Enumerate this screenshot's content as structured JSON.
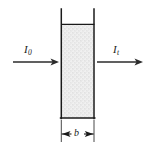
{
  "figure": {
    "type": "schematic-diagram",
    "background_color": "#ffffff",
    "line_color": "#1a1a1a",
    "fill_color": "#ebebeb"
  },
  "labels": {
    "incident_beam": {
      "symbol": "I",
      "subscript": "0",
      "text": "I0"
    },
    "transmitted_beam": {
      "symbol": "I",
      "subscript": "t",
      "text": "It"
    },
    "path_length": {
      "symbol": "b",
      "text": "b"
    }
  },
  "cuvette": {
    "name": "sample-cell",
    "fill_pattern": "stipple",
    "left_wall_x": 61,
    "right_wall_x": 94,
    "wall_top_y": 9,
    "solution_top_y": 24,
    "bottom_y": 118
  },
  "beams": {
    "incident": {
      "name": "incident-beam-arrow",
      "start_x": 13,
      "end_x": 59,
      "y": 62,
      "direction": "right"
    },
    "transmitted": {
      "name": "transmitted-beam-arrow",
      "start_x": 97,
      "end_x": 143,
      "y": 62,
      "direction": "right"
    }
  },
  "dimension": {
    "name": "path-length-dimension",
    "y": 134,
    "left_x": 61,
    "right_x": 94,
    "extension_top_y": 120,
    "extension_bottom_y": 142
  }
}
